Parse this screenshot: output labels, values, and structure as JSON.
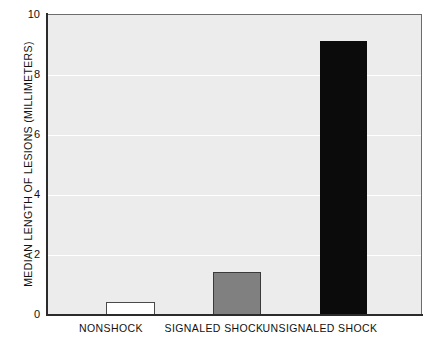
{
  "chart_data": {
    "type": "bar",
    "title": "",
    "xlabel": "",
    "ylabel": "MEDIAN LENGTH OF LESIONS (MILLIMETERS)",
    "categories": [
      "NONSHOCK",
      "SIGNALED SHOCK",
      "UNSIGNALED SHOCK"
    ],
    "values": [
      0.45,
      1.45,
      9.15
    ],
    "ylim": [
      0,
      10
    ],
    "yticks": [
      "0",
      "2",
      "4",
      "6",
      "8",
      "10"
    ],
    "ytick_values": [
      0,
      2,
      4,
      6,
      8,
      10
    ],
    "grid": "horizontal-white",
    "legend": "none",
    "bar_colors": [
      "#ffffff",
      "#808080",
      "#0b0b0b"
    ],
    "plot_background": "#ececec",
    "axis_color": "#2b2b2b"
  }
}
